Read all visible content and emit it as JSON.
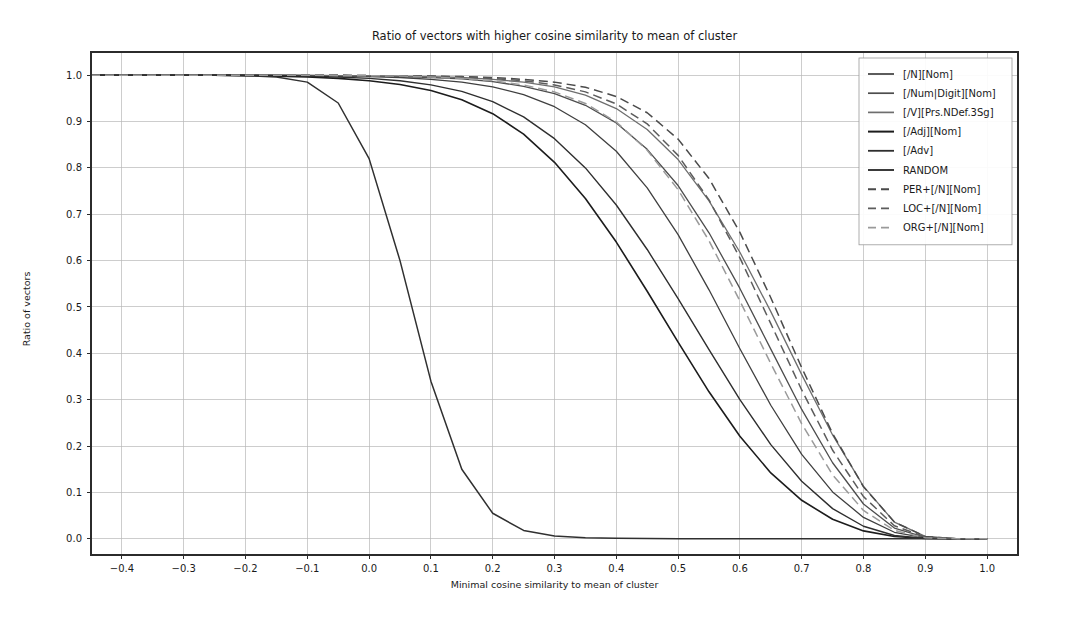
{
  "figure": {
    "width": 1068,
    "height": 617,
    "background": "#ffffff"
  },
  "chart_data": {
    "type": "line",
    "title": "Ratio of vectors with higher cosine similarity to mean of cluster",
    "xlabel": "Minimal cosine similarity to mean of cluster",
    "ylabel": "Ratio of vectors",
    "xlim": [
      -0.45,
      1.05
    ],
    "ylim": [
      -0.035,
      1.05
    ],
    "grid": true,
    "legend_position": "upper right",
    "xticks": [
      -0.4,
      -0.3,
      -0.2,
      -0.1,
      0.0,
      0.1,
      0.2,
      0.3,
      0.4,
      0.5,
      0.6,
      0.7,
      0.8,
      0.9,
      1.0
    ],
    "xtick_labels": [
      "−0.4",
      "−0.3",
      "−0.2",
      "−0.1",
      "0.0",
      "0.1",
      "0.2",
      "0.3",
      "0.4",
      "0.5",
      "0.6",
      "0.7",
      "0.8",
      "0.9",
      "1.0"
    ],
    "yticks": [
      0.0,
      0.1,
      0.2,
      0.3,
      0.4,
      0.5,
      0.6,
      0.7,
      0.8,
      0.9,
      1.0
    ],
    "ytick_labels": [
      "0.0",
      "0.1",
      "0.2",
      "0.3",
      "0.4",
      "0.5",
      "0.6",
      "0.7",
      "0.8",
      "0.9",
      "1.0"
    ],
    "x": [
      -0.45,
      -0.4,
      -0.35,
      -0.3,
      -0.25,
      -0.2,
      -0.15,
      -0.1,
      -0.05,
      0.0,
      0.05,
      0.1,
      0.15,
      0.2,
      0.25,
      0.3,
      0.35,
      0.4,
      0.45,
      0.5,
      0.55,
      0.6,
      0.65,
      0.7,
      0.75,
      0.8,
      0.85,
      0.9,
      0.95,
      1.0
    ],
    "series": [
      {
        "name": "[/N][Nom]",
        "color": "#3f3f3f",
        "dash": "solid",
        "width": 1.3,
        "values": [
          1.0,
          1.0,
          1.0,
          1.0,
          1.0,
          1.0,
          1.0,
          0.999,
          0.998,
          0.997,
          0.995,
          0.991,
          0.985,
          0.975,
          0.958,
          0.932,
          0.893,
          0.836,
          0.757,
          0.656,
          0.537,
          0.41,
          0.288,
          0.182,
          0.101,
          0.046,
          0.014,
          0.002,
          0.0,
          0.0
        ]
      },
      {
        "name": "[/Num|Digit][Nom]",
        "color": "#4d4d4d",
        "dash": "solid",
        "width": 1.3,
        "values": [
          1.0,
          1.0,
          1.0,
          1.0,
          1.0,
          1.0,
          1.0,
          0.999,
          0.999,
          0.998,
          0.997,
          0.995,
          0.992,
          0.986,
          0.976,
          0.96,
          0.935,
          0.897,
          0.84,
          0.762,
          0.66,
          0.54,
          0.409,
          0.279,
          0.164,
          0.075,
          0.023,
          0.003,
          0.0,
          0.0
        ]
      },
      {
        "name": "[/V][Prs.NDef.3Sg]",
        "color": "#6e6e6e",
        "dash": "solid",
        "width": 1.3,
        "values": [
          1.0,
          1.0,
          1.0,
          1.0,
          1.0,
          1.0,
          1.0,
          1.0,
          0.999,
          0.999,
          0.998,
          0.997,
          0.995,
          0.991,
          0.985,
          0.975,
          0.957,
          0.928,
          0.883,
          0.818,
          0.729,
          0.618,
          0.49,
          0.354,
          0.224,
          0.113,
          0.036,
          0.005,
          0.0,
          0.0
        ]
      },
      {
        "name": "[/Adj][Nom]",
        "color": "#1c1c1c",
        "dash": "solid",
        "width": 1.6,
        "values": [
          1.0,
          1.0,
          1.0,
          1.0,
          1.0,
          0.999,
          0.998,
          0.996,
          0.993,
          0.988,
          0.98,
          0.967,
          0.947,
          0.917,
          0.873,
          0.812,
          0.734,
          0.64,
          0.534,
          0.424,
          0.317,
          0.221,
          0.142,
          0.083,
          0.042,
          0.017,
          0.005,
          0.0005,
          0.0,
          0.0
        ]
      },
      {
        "name": "[/Adv]",
        "color": "#2e2e2e",
        "dash": "solid",
        "width": 1.4,
        "values": [
          1.0,
          1.0,
          1.0,
          1.0,
          1.0,
          1.0,
          0.999,
          0.998,
          0.996,
          0.993,
          0.988,
          0.979,
          0.965,
          0.943,
          0.91,
          0.863,
          0.8,
          0.72,
          0.624,
          0.518,
          0.408,
          0.3,
          0.203,
          0.124,
          0.065,
          0.027,
          0.007,
          0.0008,
          0.0,
          0.0
        ]
      },
      {
        "name": "RANDOM",
        "color": "#303030",
        "dash": "solid",
        "width": 1.5,
        "values": [
          1.0,
          1.0,
          1.0,
          1.0,
          1.0,
          0.999,
          0.996,
          0.985,
          0.94,
          0.82,
          0.6,
          0.34,
          0.15,
          0.055,
          0.018,
          0.006,
          0.002,
          0.001,
          0.0005,
          0.0002,
          0.0001,
          0.0,
          0.0,
          0.0,
          0.0,
          0.0,
          0.0,
          0.0,
          0.0,
          0.0
        ]
      },
      {
        "name": "PER+[/N][Nom]",
        "color": "#4a4a4a",
        "dash": "dashed",
        "width": 1.5,
        "values": [
          1.0,
          1.0,
          1.0,
          1.0,
          1.0,
          1.0,
          1.0,
          1.0,
          1.0,
          0.999,
          0.999,
          0.998,
          0.997,
          0.995,
          0.991,
          0.985,
          0.974,
          0.954,
          0.919,
          0.862,
          0.777,
          0.661,
          0.52,
          0.369,
          0.227,
          0.112,
          0.036,
          0.005,
          0.0,
          0.0
        ]
      },
      {
        "name": "LOC+[/N][Nom]",
        "color": "#5c5c5c",
        "dash": "dashed",
        "width": 1.5,
        "values": [
          1.0,
          1.0,
          1.0,
          1.0,
          1.0,
          1.0,
          1.0,
          1.0,
          1.0,
          0.999,
          0.999,
          0.998,
          0.996,
          0.993,
          0.988,
          0.979,
          0.964,
          0.938,
          0.895,
          0.827,
          0.731,
          0.606,
          0.464,
          0.321,
          0.191,
          0.091,
          0.028,
          0.004,
          0.0,
          0.0
        ]
      },
      {
        "name": "ORG+[/N][Nom]",
        "color": "#9a9a9a",
        "dash": "dashed",
        "width": 1.5,
        "values": [
          1.0,
          1.0,
          1.0,
          1.0,
          1.0,
          1.0,
          1.0,
          1.0,
          0.999,
          0.999,
          0.998,
          0.996,
          0.993,
          0.988,
          0.979,
          0.964,
          0.939,
          0.899,
          0.838,
          0.753,
          0.643,
          0.513,
          0.378,
          0.248,
          0.138,
          0.061,
          0.018,
          0.002,
          0.0,
          0.0
        ]
      }
    ]
  }
}
